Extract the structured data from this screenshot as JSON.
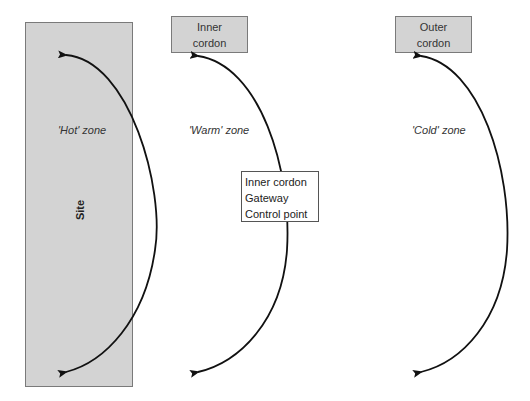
{
  "diagram": {
    "site": {
      "label": "Site",
      "color": "#d3d3d3"
    },
    "cordons": [
      {
        "id": "inner",
        "line1": "Inner",
        "line2": "cordon"
      },
      {
        "id": "outer",
        "line1": "Outer",
        "line2": "cordon"
      }
    ],
    "zones": [
      {
        "id": "hot",
        "label": "'Hot' zone"
      },
      {
        "id": "warm",
        "label": "'Warm' zone"
      },
      {
        "id": "cold",
        "label": "'Cold' zone"
      }
    ],
    "infobox": {
      "lines": [
        "Inner cordon",
        "Gateway",
        "Control point"
      ]
    },
    "arrows": [
      {
        "zone": "hot",
        "type": "double-headed curved"
      },
      {
        "zone": "warm",
        "type": "double-headed curved"
      },
      {
        "zone": "cold",
        "type": "double-headed curved"
      }
    ]
  }
}
